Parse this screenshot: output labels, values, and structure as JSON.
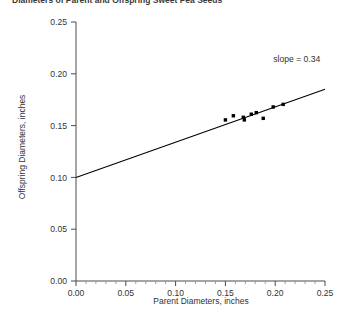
{
  "chart_data": {
    "type": "scatter",
    "title": "Diameters of Parent and Offspring Sweet Pea Seeds",
    "xlabel": "Parent Diameters, inches",
    "ylabel": "Offspring Diameters, inches",
    "xlim": [
      0.0,
      0.25
    ],
    "ylim": [
      0.0,
      0.25
    ],
    "xticks": [
      0.0,
      0.05,
      0.1,
      0.15,
      0.2,
      0.25
    ],
    "xtick_labels": [
      "0.00",
      "0.05",
      "0.10",
      "0.15",
      "0.20",
      "0.25"
    ],
    "yticks": [
      0.0,
      0.05,
      0.1,
      0.15,
      0.2,
      0.25
    ],
    "ytick_labels": [
      "0.00",
      "0.05",
      "0.10",
      "0.15",
      "0.20",
      "0.25"
    ],
    "grid": false,
    "legend": null,
    "series": [
      {
        "name": "Parent vs Offspring seed diameter",
        "marker": "filled-square",
        "color": "#000000",
        "points": [
          {
            "x": 0.15,
            "y": 0.1555
          },
          {
            "x": 0.158,
            "y": 0.1595
          },
          {
            "x": 0.168,
            "y": 0.158
          },
          {
            "x": 0.169,
            "y": 0.1555
          },
          {
            "x": 0.176,
            "y": 0.161
          },
          {
            "x": 0.181,
            "y": 0.1625
          },
          {
            "x": 0.188,
            "y": 0.157
          },
          {
            "x": 0.198,
            "y": 0.168
          },
          {
            "x": 0.208,
            "y": 0.1705
          }
        ]
      }
    ],
    "fit_line": {
      "slope": 0.34,
      "intercept": 0.1,
      "x_start": 0.0,
      "y_start": 0.1,
      "x_end": 0.25,
      "y_end": 0.185,
      "color": "#000000"
    },
    "annotations": [
      {
        "name": "slope-annotation",
        "text": "slope = 0.34",
        "x": 0.198,
        "y": 0.211
      }
    ]
  }
}
